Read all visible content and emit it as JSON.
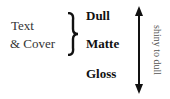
{
  "left_label": {
    "line1": "Text",
    "line2": "& Cover"
  },
  "finishes": [
    "Dull",
    "Matte",
    "Gloss"
  ],
  "axis_label": "shiny to dull",
  "icons": {
    "brace": "right-curly-brace-icon",
    "arrow": "double-headed-vertical-arrow-icon"
  }
}
